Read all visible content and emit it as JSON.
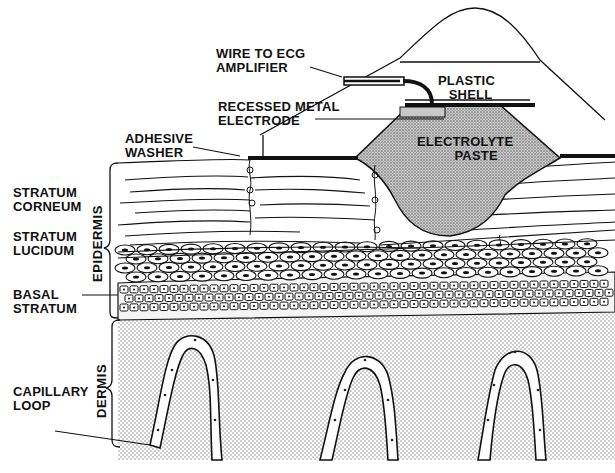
{
  "diagram": {
    "title": "",
    "colors": {
      "ink": "#111111",
      "paste_fill": "#b8b8b8",
      "dermis_fill": "#d9d9d9",
      "background": "#ffffff"
    },
    "labels": {
      "wire": [
        "WIRE TO ECG",
        "AMPLIFIER"
      ],
      "plastic_shell": [
        "PLASTIC",
        "SHELL"
      ],
      "recessed_electrode": [
        "RECESSED METAL",
        "ELECTRODE"
      ],
      "electrolyte_paste": [
        "ELECTROLYTE",
        "PASTE"
      ],
      "adhesive_washer": [
        "ADHESIVE",
        "WASHER"
      ],
      "stratum_corneum": [
        "STRATUM",
        "CORNEUM"
      ],
      "stratum_lucidum": [
        "STRATUM",
        "LUCIDUM"
      ],
      "basal_stratum": [
        "BASAL",
        "STRATUM"
      ],
      "capillary_loop": [
        "CAPILLARY",
        "LOOP"
      ],
      "epidermis": "EPIDERMIS",
      "dermis": "DERMIS"
    }
  }
}
